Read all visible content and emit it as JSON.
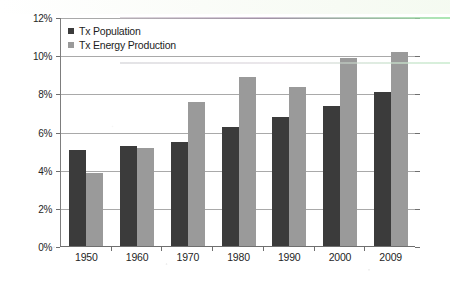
{
  "chart_data": {
    "type": "bar",
    "title": "",
    "subtitle": "",
    "xlabel": "",
    "ylabel": "",
    "categories": [
      "1950",
      "1960",
      "1970",
      "1980",
      "1990",
      "2000",
      "2009"
    ],
    "series": [
      {
        "name": "Tx Population",
        "color": "#3b3b3b",
        "values": [
          5.1,
          5.3,
          5.5,
          6.3,
          6.8,
          7.4,
          8.1
        ]
      },
      {
        "name": "Tx Energy Production",
        "color": "#9a9a9a",
        "values": [
          3.9,
          5.2,
          7.6,
          8.9,
          8.4,
          9.9,
          10.2
        ]
      }
    ],
    "ylim": [
      0,
      12
    ],
    "ytick_step": 2,
    "ytick_labels": [
      "0%",
      "2%",
      "4%",
      "6%",
      "8%",
      "10%",
      "12%"
    ],
    "ytick_values": [
      0,
      2,
      4,
      6,
      8,
      10,
      12
    ],
    "value_unit": "%",
    "grid": true,
    "grid_axis": "y",
    "legend_position": "top-left",
    "legend_entries": [
      "Tx Population",
      "Tx Energy Production"
    ]
  },
  "colors": {
    "series_population": "#3b3b3b",
    "series_energy": "#9a9a9a",
    "gridline": "#a9a9a9",
    "axis": "#6f6f6f",
    "text": "#1f1f1f",
    "background": "#ffffff"
  }
}
